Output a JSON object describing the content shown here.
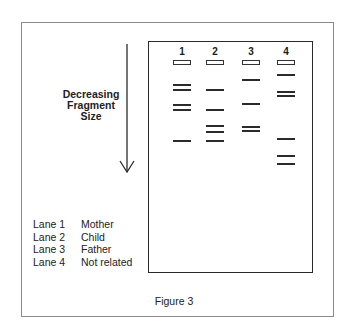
{
  "figure": {
    "caption": "Figure 3",
    "axis_label_lines": [
      "Decreasing",
      "Fragment",
      "Size"
    ],
    "arrow_direction": "down"
  },
  "gel": {
    "lanes": [
      {
        "number": "1",
        "x": 173,
        "well_y": 60,
        "bands_y": [
          84,
          89,
          104,
          109,
          140
        ]
      },
      {
        "number": "2",
        "x": 206,
        "well_y": 60,
        "bands_y": [
          89,
          109,
          125,
          131,
          140
        ]
      },
      {
        "number": "3",
        "x": 242,
        "well_y": 60,
        "bands_y": [
          79,
          103,
          126,
          130
        ]
      },
      {
        "number": "4",
        "x": 277,
        "well_y": 60,
        "bands_y": [
          74,
          91,
          95,
          138,
          155,
          163
        ]
      }
    ]
  },
  "legend": [
    {
      "lane": "Lane 1",
      "label": "Mother"
    },
    {
      "lane": "Lane 2",
      "label": "Child"
    },
    {
      "lane": "Lane 3",
      "label": "Father"
    },
    {
      "lane": "Lane 4",
      "label": "Not related"
    }
  ],
  "colors": {
    "ink": "#2b2b2b",
    "frame": "#8a8a8a",
    "background": "#ffffff"
  }
}
